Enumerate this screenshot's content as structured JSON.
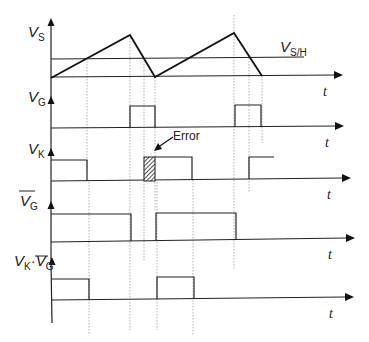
{
  "diagram": {
    "channels": [
      {
        "id": "vs",
        "label": "V",
        "subscript": "S",
        "overbar": false,
        "time_label": "t"
      },
      {
        "id": "vg",
        "label": "V",
        "subscript": "G",
        "overbar": false,
        "time_label": "t"
      },
      {
        "id": "vk",
        "label": "V",
        "subscript": "K",
        "overbar": false,
        "time_label": "t"
      },
      {
        "id": "vg_bar",
        "label": "V",
        "subscript": "G",
        "overbar": true,
        "time_label": "t"
      },
      {
        "id": "vk_and_vg_bar",
        "label_left": "V",
        "sub_left": "K",
        "operator": "·",
        "label_right": "V",
        "sub_right": "G",
        "overbar_right": true,
        "time_label": "t"
      }
    ],
    "threshold": {
      "label": "V",
      "subscript": "S/H"
    },
    "annotation": {
      "text": "Error"
    },
    "colors": {
      "line": "#222222",
      "guide": "#999999",
      "background": "#ffffff"
    }
  }
}
